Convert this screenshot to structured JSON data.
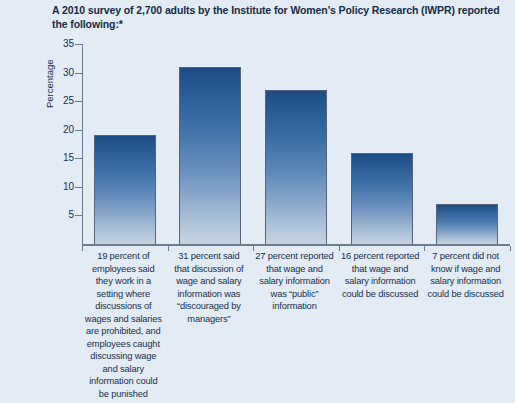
{
  "figure": {
    "title": "A 2010 survey of 2,700 adults by the Institute for Women's Policy Research (IWPR) reported the following:*"
  },
  "axes": {
    "y_title": "Percentage",
    "y_ticks": [
      "5",
      "10",
      "15",
      "20",
      "25",
      "30",
      "35"
    ]
  },
  "colors": {
    "background": "#e3ebf4",
    "bar_top": "#1d4c85",
    "bar_bottom": "#c6d3e0",
    "bar_border": "#56657a",
    "axis": "#6b7d91",
    "text": "#17304f"
  },
  "chart_data": {
    "type": "bar",
    "title": "A 2010 survey of 2,700 adults by the Institute for Women's Policy Research (IWPR) reported the following:*",
    "xlabel": "",
    "ylabel": "Percentage",
    "ylim": [
      0,
      35
    ],
    "ytick_step": 5,
    "grid": false,
    "legend": false,
    "categories": [
      "19 percent of employees said they work in a setting where discussions of wages and salaries are prohibited, and employees caught discussing wage and salary information could be punished",
      "31 percent said that discussion of wage and salary information was \"discouraged by managers\"",
      "27 percent reported that wage and salary information was \"public\" information",
      "16 percent reported that wage and salary information could be discussed",
      "7 percent did not know if wage and salary information could be discussed"
    ],
    "values": [
      19,
      31,
      27,
      16,
      7
    ]
  },
  "category_labels": [
    "19 percent of employees said they work in a setting where discussions of wages and salaries are prohibited, and employees caught discussing wage and salary information could be punished",
    "31 percent said that discussion of wage and salary information was “discouraged by managers”",
    "27 percent reported that wage and salary information was “public” information",
    "16 percent reported that wage and salary information could be discussed",
    "7 percent did not know if wage and salary information could be discussed"
  ]
}
